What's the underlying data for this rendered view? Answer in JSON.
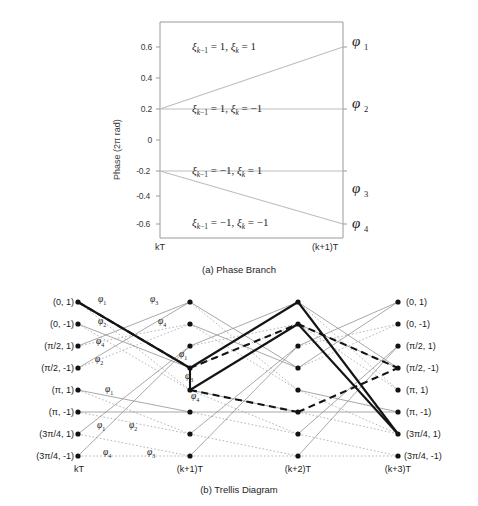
{
  "figure": {
    "panel_a": {
      "caption": "(a) Phase Branch",
      "y_axis_label": "Phase (2π rad)",
      "y_ticks": [
        "0.6",
        "0.4",
        "0.2",
        "0",
        "-0.2",
        "-0.4",
        "-0.6"
      ],
      "y_tick_values": [
        0.6,
        0.4,
        0.2,
        0,
        -0.2,
        -0.4,
        -0.6
      ],
      "x_ticks": [
        "kT",
        "(k+1)T"
      ],
      "conditions": [
        {
          "text_plain": "ξ_{k-1} = 1, ξ_k = 1",
          "phi": "φ",
          "phi_index": "1"
        },
        {
          "text_plain": "ξ_{k-1} = 1, ξ_k = -1",
          "phi": "φ",
          "phi_index": "2"
        },
        {
          "text_plain": "ξ_{k-1} = -1, ξ_k = 1",
          "phi": "φ",
          "phi_index": "3"
        },
        {
          "text_plain": "ξ_{k-1} = -1, ξ_k = -1",
          "phi": "φ",
          "phi_index": "4"
        }
      ],
      "branches": [
        {
          "label": "φ 1",
          "from": 0.2,
          "to": 0.6
        },
        {
          "label": "φ 2",
          "from": 0.2,
          "to": 0.2
        },
        {
          "label": "φ 3",
          "from": -0.2,
          "to": -0.2
        },
        {
          "label": "φ 4",
          "from": -0.2,
          "to": -0.6
        }
      ]
    },
    "panel_b": {
      "caption": "(b) Trellis Diagram",
      "time_axis": [
        "kT",
        "(k+1)T",
        "(k+2)T",
        "(k+3)T"
      ],
      "states": [
        "(0,  1)",
        "(0, -1)",
        "(π/2, 1)",
        "(π/2, -1)",
        "(π, 1)",
        "(π, -1)",
        "(3π/4, 1)",
        "(3π/4, -1)"
      ],
      "branch_labels": [
        {
          "phi": "φ",
          "idx": "1",
          "x": 103,
          "y": 300
        },
        {
          "phi": "φ",
          "idx": "2",
          "x": 103,
          "y": 322
        },
        {
          "phi": "φ",
          "idx": "4",
          "x": 101,
          "y": 341
        },
        {
          "phi": "φ",
          "idx": "2",
          "x": 100,
          "y": 359
        },
        {
          "phi": "φ",
          "idx": "1",
          "x": 110,
          "y": 389
        },
        {
          "phi": "φ",
          "idx": "1",
          "x": 102,
          "y": 425
        },
        {
          "phi": "φ",
          "idx": "2",
          "x": 134,
          "y": 425
        },
        {
          "phi": "φ",
          "idx": "4",
          "x": 108,
          "y": 452
        },
        {
          "phi": "φ",
          "idx": "3",
          "x": 152,
          "y": 452
        },
        {
          "phi": "φ",
          "idx": "3",
          "x": 155,
          "y": 300
        },
        {
          "phi": "φ",
          "idx": "4",
          "x": 163,
          "y": 322
        },
        {
          "phi": "φ",
          "idx": "1",
          "x": 184,
          "y": 355
        },
        {
          "phi": "φ",
          "idx": "3",
          "x": 190,
          "y": 377
        },
        {
          "phi": "φ",
          "idx": "4",
          "x": 196,
          "y": 397
        }
      ]
    }
  }
}
